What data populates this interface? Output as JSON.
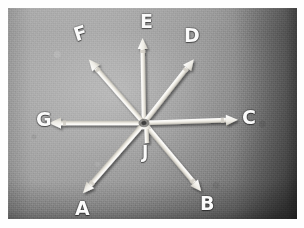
{
  "image": {
    "kind": "photograph",
    "subject": "white pencil-shaped arrows radiating outward from a single central point on a grey board",
    "background_color": "#9a9a9a",
    "paper_border_color": "#ffffff",
    "stick_color": "#f4f2ec",
    "label_color": "#fbfbfb",
    "width": 304,
    "height": 228
  },
  "center": {
    "label": "convergence-point",
    "x": 144,
    "y": 123
  },
  "arrows": [
    {
      "id": "A",
      "label": "A",
      "direction": "down-left",
      "angle_deg": 228,
      "tip_x": 88,
      "tip_y": 196,
      "label_x": 75,
      "label_y": 199
    },
    {
      "id": "B",
      "label": "B",
      "direction": "down-right",
      "angle_deg": 312,
      "tip_x": 195,
      "tip_y": 192,
      "label_x": 200,
      "label_y": 194
    },
    {
      "id": "C",
      "label": "C",
      "direction": "right",
      "angle_deg": 0,
      "tip_x": 235,
      "tip_y": 120,
      "label_x": 242,
      "label_y": 108
    },
    {
      "id": "D",
      "label": "D",
      "direction": "up-right",
      "angle_deg": 52,
      "tip_x": 186,
      "tip_y": 45,
      "label_x": 184,
      "label_y": 26
    },
    {
      "id": "E",
      "label": "E",
      "direction": "up",
      "angle_deg": 90,
      "tip_x": 146,
      "tip_y": 35,
      "label_x": 140,
      "label_y": 12
    },
    {
      "id": "F",
      "label": "F",
      "direction": "up-left",
      "angle_deg": 131,
      "tip_x": 96,
      "tip_y": 45,
      "label_x": 74,
      "label_y": 24
    },
    {
      "id": "G",
      "label": "G",
      "direction": "left",
      "angle_deg": 180,
      "tip_x": 57,
      "tip_y": 126,
      "label_x": 36,
      "label_y": 110
    },
    {
      "id": "J",
      "label": "J",
      "direction": "up (short arrow pointing at centre)",
      "angle_deg": 90,
      "tip_x": 147,
      "tip_y": 133,
      "label_x": 140,
      "label_y": 144
    }
  ],
  "labels_in_order": [
    "F",
    "E",
    "D",
    "G",
    "C",
    "J",
    "A",
    "B"
  ]
}
